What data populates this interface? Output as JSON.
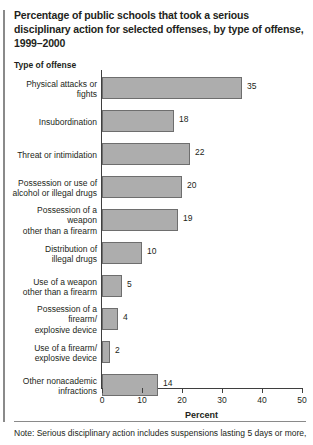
{
  "title": "Percentage of public schools that took a serious disciplinary action for selected offenses, by type of offense, 1999–2000",
  "column_header": "Type of offense",
  "note": "Note: Serious disciplinary action includes suspensions lasting 5 days or more,",
  "colors": {
    "bar_fill": "#adadad",
    "bar_border": "#6e6e6e",
    "axis": "#3f3f3f",
    "text": "#231f20",
    "rule": "#8a8a8a",
    "background": "#ffffff"
  },
  "chart_data": {
    "type": "bar",
    "orientation": "horizontal",
    "title": "Percentage of public schools that took a serious disciplinary action for selected offenses, by type of offense, 1999–2000",
    "xlabel": "Percent",
    "ylabel": "Type of offense",
    "xlim": [
      0,
      50
    ],
    "xticks": [
      0,
      10,
      20,
      30,
      40,
      50
    ],
    "grid": false,
    "legend": null,
    "categories": [
      "Physical attacks or fights",
      "Insubordination",
      "Threat or intimidation",
      "Possession or use of alcohol or illegal drugs",
      "Possession of a weapon other than a firearm",
      "Distribution of illegal drugs",
      "Use of a weapon other than a firearm",
      "Possession of a firearm/ explosive device",
      "Use of a firearm/ explosive device",
      "Other nonacademic infractions"
    ],
    "category_lines": [
      [
        "Physical attacks or fights"
      ],
      [
        "Insubordination"
      ],
      [
        "Threat or intimidation"
      ],
      [
        "Possession or use of",
        "alcohol or illegal drugs"
      ],
      [
        "Possession of a weapon",
        "other than a firearm"
      ],
      [
        "Distribution of",
        "illegal drugs"
      ],
      [
        "Use of a weapon",
        "other than a firearm"
      ],
      [
        "Possession of a firearm/",
        "explosive device"
      ],
      [
        "Use of a firearm/",
        "explosive device"
      ],
      [
        "Other nonacademic",
        "infractions"
      ]
    ],
    "values": [
      35,
      18,
      22,
      20,
      19,
      10,
      5,
      4,
      2,
      14
    ],
    "value_labels": [
      "35",
      "18",
      "22",
      "20",
      "19",
      "10",
      "5",
      "4",
      "2",
      "14"
    ]
  }
}
